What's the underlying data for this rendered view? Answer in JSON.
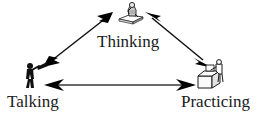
{
  "diagram": {
    "type": "triangle-cycle",
    "background_color": "#ffffff",
    "stroke_color": "#000000",
    "text_color": "#1a1a1a",
    "nodes": [
      {
        "id": "thinking",
        "label": "Thinking",
        "position": "top",
        "icon": "thinker-statue-icon",
        "icon_description": "seated thinking figure on a pedestal"
      },
      {
        "id": "talking",
        "label": "Talking",
        "position": "bottom-left",
        "icon": "person-with-megaphone-icon",
        "icon_description": "silhouette of a person holding a megaphone"
      },
      {
        "id": "practicing",
        "label": "Practicing",
        "position": "bottom-right",
        "icon": "person-at-workbench-icon",
        "icon_description": "person working at a desk or workbench"
      }
    ],
    "connectors": [
      {
        "id": "talking-thinking",
        "from": "talking",
        "to": "thinking",
        "style": "double-headed-arrow"
      },
      {
        "id": "thinking-practicing",
        "from": "thinking",
        "to": "practicing",
        "style": "double-headed-arrow"
      },
      {
        "id": "talking-practicing",
        "from": "talking",
        "to": "practicing",
        "style": "double-headed-arrow"
      }
    ]
  }
}
